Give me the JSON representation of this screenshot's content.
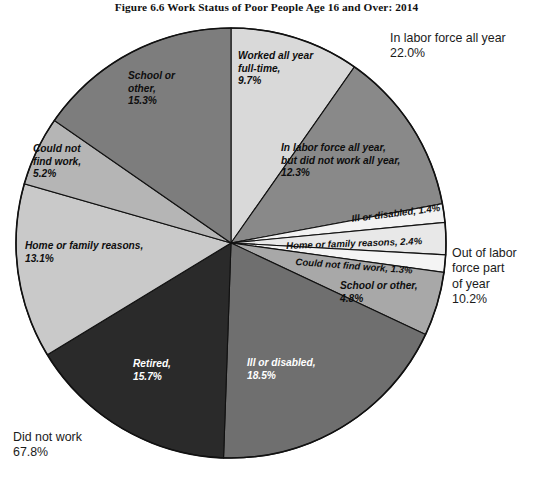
{
  "figure": {
    "title": "Figure 6.6  Work Status of Poor People Age 16 and Over: 2014"
  },
  "outer_labels": {
    "in_labor_force": "In labor force all year\n22.0%",
    "out_of_labor_force": "Out of labor\nforce part\nof year\n10.2%",
    "did_not_work": "Did not work\n67.8%"
  },
  "slice_labels": {
    "worked_all_year_full_time": "Worked all year\nfull-time,\n9.7%",
    "in_lf_not_work_all_year": "In labor force all year,\nbut did not work all year,\n12.3%",
    "ill_or_disabled_small": "Ill or disabled, 1.4%",
    "home_or_family_small": "Home or family reasons, 2.4%",
    "could_not_find_work_small": "Could not find work, 1.3%",
    "school_or_other_small": "School or other,\n4.8%",
    "ill_or_disabled_large": "Ill or disabled,\n18.5%",
    "retired": "Retired,\n15.7%",
    "home_or_family_large": "Home or family reasons,\n13.1%",
    "could_not_find_work_large": "Could not\nfind work,\n5.2%",
    "school_or_other_large": "School or\nother,\n15.3%"
  },
  "chart_data": {
    "type": "pie",
    "title": "Figure 6.6  Work Status of Poor People Age 16 and Over: 2014",
    "start_angle_deg": 0,
    "direction": "clockwise",
    "total_percent": 100.0,
    "categories": [
      "Worked all year full-time",
      "In labor force all year, but did not work all year",
      "Ill or disabled (out of labor force part of year)",
      "Home or family reasons (out of labor force part of year)",
      "Could not find work (out of labor force part of year)",
      "School or other (out of labor force part of year)",
      "Ill or disabled (did not work)",
      "Retired (did not work)",
      "Home or family reasons (did not work)",
      "Could not find work (did not work)",
      "School or other (did not work)"
    ],
    "values": [
      9.7,
      12.3,
      1.4,
      2.4,
      1.3,
      4.8,
      18.5,
      15.7,
      13.1,
      5.2,
      15.3
    ],
    "colors": [
      "#d9d9d9",
      "#898989",
      "#f2f2f2",
      "#e8e8e8",
      "#f4f4f4",
      "#a8a8a8",
      "#6f6f6f",
      "#2a2a2a",
      "#c9c9c9",
      "#b5b5b5",
      "#7d7d7d"
    ],
    "groups": [
      {
        "name": "In labor force all year",
        "percent": 22.0,
        "members": [
          "Worked all year full-time",
          "In labor force all year, but did not work all year"
        ]
      },
      {
        "name": "Out of labor force part of year",
        "percent": 10.2,
        "members": [
          "Ill or disabled",
          "Home or family reasons",
          "Could not find work",
          "School or other"
        ]
      },
      {
        "name": "Did not work",
        "percent": 67.8,
        "members": [
          "Ill or disabled",
          "Retired",
          "Home or family reasons",
          "Could not find work",
          "School or other"
        ]
      }
    ],
    "legend": "none",
    "grid": false
  }
}
